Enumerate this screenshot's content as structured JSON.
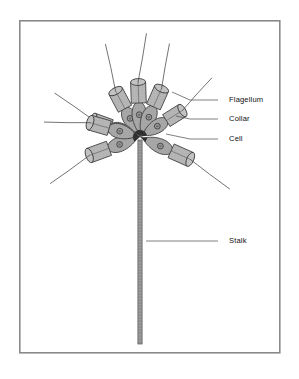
{
  "figure": {
    "frame": {
      "x": 19,
      "y": 20,
      "width": 260,
      "height": 332,
      "stroke": "#8a8a8a",
      "fill": "#ffffff",
      "stroke_width": 1.6
    },
    "background_color": "#ffffff"
  },
  "colors": {
    "cell_fill": "#a8a8a8",
    "collar_fill": "#b4b4b4",
    "collar_fill_light": "#c2c2c2",
    "outline": "#3a3a3a",
    "nucleus_fill": "#9a9a9a",
    "nucleus_outline": "#333333",
    "flagellum": "#444444",
    "stalk_fill": "#9e9e9e",
    "stalk_outline": "#555555",
    "leader_line": "#555555",
    "label_text": "#111111"
  },
  "labels": [
    {
      "id": "flagellum",
      "text": "Flagellum",
      "text_x": 229,
      "text_y": 100,
      "leader": {
        "x1": 218,
        "y1": 100,
        "x2": 190,
        "y2": 100,
        "x3": 172,
        "y3": 92
      }
    },
    {
      "id": "collar",
      "text": "Collar",
      "text_x": 229,
      "text_y": 119,
      "leader": {
        "x1": 218,
        "y1": 119,
        "x2": 190,
        "y2": 119,
        "x3": 176,
        "y3": 116
      }
    },
    {
      "id": "cell",
      "text": "Cell",
      "text_x": 229,
      "text_y": 139,
      "leader": {
        "x1": 218,
        "y1": 139,
        "x2": 190,
        "y2": 139,
        "x3": 166,
        "y3": 134
      }
    },
    {
      "id": "stalk",
      "text": "Stalk",
      "text_x": 229,
      "text_y": 241,
      "leader": {
        "x1": 218,
        "y1": 241,
        "x2": 146,
        "y2": 241,
        "x3": 146,
        "y3": 241
      }
    }
  ],
  "colony": {
    "center_x": 140,
    "center_y": 137,
    "cell_count": 8,
    "cells": [
      {
        "id": "cell-1",
        "angle_deg": -118,
        "body_len": 34,
        "body_w": 17,
        "collar_len": 20,
        "collar_w": 15,
        "flagellum_len": 46,
        "flagellum_bend": 13
      },
      {
        "id": "cell-2",
        "angle_deg": -92,
        "body_len": 36,
        "body_w": 17,
        "collar_len": 21,
        "collar_w": 15,
        "flagellum_len": 48,
        "flagellum_bend": 10
      },
      {
        "id": "cell-3",
        "angle_deg": -66,
        "body_len": 35,
        "body_w": 17,
        "collar_len": 20,
        "collar_w": 15,
        "flagellum_len": 44,
        "flagellum_bend": -11
      },
      {
        "id": "cell-4",
        "angle_deg": -32,
        "body_len": 33,
        "body_w": 16,
        "collar_len": 19,
        "collar_w": 14,
        "flagellum_len": 42,
        "flagellum_bend": -12
      },
      {
        "id": "cell-5",
        "angle_deg": -160,
        "body_len": 33,
        "body_w": 16,
        "collar_len": 19,
        "collar_w": 14,
        "flagellum_len": 45,
        "flagellum_bend": 12
      },
      {
        "id": "cell-6",
        "angle_deg": 160,
        "body_len": 35,
        "body_w": 17,
        "collar_len": 21,
        "collar_w": 15,
        "flagellum_len": 46,
        "flagellum_bend": -13
      },
      {
        "id": "cell-7",
        "angle_deg": 196,
        "body_len": 34,
        "body_w": 17,
        "collar_len": 20,
        "collar_w": 15,
        "flagellum_len": 44,
        "flagellum_bend": -12
      },
      {
        "id": "cell-8",
        "angle_deg": 24,
        "body_len": 36,
        "body_w": 17,
        "collar_len": 21,
        "collar_w": 15,
        "flagellum_len": 48,
        "flagellum_bend": 11
      }
    ]
  },
  "stalk": {
    "top_x": 140,
    "top_y": 140,
    "bottom_y": 344,
    "width": 4.2
  }
}
